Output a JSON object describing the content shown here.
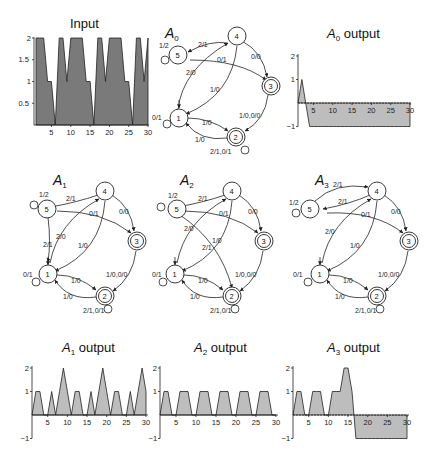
{
  "figure": {
    "panels": {
      "input": {
        "title": "Input"
      },
      "A0": {
        "title_main": "A",
        "title_sub": "0"
      },
      "A0_output": {
        "title_main": "A",
        "title_sub": "0",
        "title_rest": " output"
      },
      "A1": {
        "title_main": "A",
        "title_sub": "1"
      },
      "A2": {
        "title_main": "A",
        "title_sub": "2"
      },
      "A3": {
        "title_main": "A",
        "title_sub": "3"
      },
      "A1_output": {
        "title_main": "A",
        "title_sub": "1",
        "title_rest": " output"
      },
      "A2_output": {
        "title_main": "A",
        "title_sub": "2",
        "title_rest": " output"
      },
      "A3_output": {
        "title_main": "A",
        "title_sub": "3",
        "title_rest": " output"
      }
    },
    "colors": {
      "input_fill": "#7a7a7a",
      "output_fill": "#bdbdbd",
      "line": "#222222"
    }
  },
  "automata": {
    "nodes": {
      "n1": "1",
      "n2": "2",
      "n3": "3",
      "n4": "4",
      "n5": "5"
    },
    "A0": {
      "e_5_self": "1/2",
      "e_4_5": "2/1",
      "e_5_3": "0/1",
      "e_4_3": "0/0",
      "e_1_4": "2/0",
      "e_4_1": "1/0",
      "e_1_self": "0/1",
      "e_1_2": "1/0",
      "e_2_1": "1/0",
      "e_3_2": "1/0,0/0",
      "e_2_self": "2/1,0/1"
    },
    "A1": {
      "e_5_self": "1/2",
      "e_4_5": "2/1",
      "e_5_3": "0/1",
      "e_4_3": "0/0",
      "e_1_4": "2/0",
      "e_5_1": "2/1",
      "e_4_1": "1/0",
      "e_1_self": "0/1",
      "e_1_2": "1/0",
      "e_2_1": "1/0",
      "e_3_2": "1/0,0/0",
      "e_2_self": "2/1,0/1"
    },
    "A2": {
      "e_5_self": "1/2",
      "e_4_5": "2/1",
      "e_5_3": "0/1",
      "e_4_3": "0/0",
      "e_1_4": "2/0",
      "e_5_2": "2/1",
      "e_4_1": "1/0",
      "e_1_self": "0/1",
      "e_1_2": "1/0",
      "e_2_1": "1/0",
      "e_3_2": "1/0,0/0",
      "e_2_self": "2/1,0/1"
    },
    "A3": {
      "e_5_self": "1/2",
      "e_5_4": "2/1",
      "e_4_5": "2/1",
      "e_5_3": "0/1",
      "e_4_3": "0/0",
      "e_1_4": "2/0",
      "e_4_1": "1/0",
      "e_1_self": "0/1",
      "e_1_2": "1/0",
      "e_2_1": "1/0",
      "e_3_2": "1/0,0/0",
      "e_2_self": "2/1,0/1"
    }
  },
  "chart_data": [
    {
      "id": "input",
      "type": "area",
      "title": "Input",
      "xlabel": "",
      "ylabel": "",
      "xlim": [
        1,
        30
      ],
      "ylim": [
        0,
        2
      ],
      "xticks": [
        "5",
        "10",
        "15",
        "20",
        "25",
        "30"
      ],
      "yticks": [
        "0.5",
        "1",
        "1.5",
        "2"
      ],
      "x": [
        1,
        2,
        3,
        4,
        5,
        6,
        7,
        8,
        9,
        10,
        11,
        12,
        13,
        14,
        15,
        16,
        17,
        18,
        19,
        20,
        21,
        22,
        23,
        24,
        25,
        26,
        27,
        28,
        29,
        30
      ],
      "values": [
        2,
        2,
        2,
        1,
        1,
        0,
        2,
        2,
        1,
        2,
        2,
        2,
        2,
        1,
        1,
        0,
        2,
        2,
        1,
        2,
        2,
        2,
        2,
        1,
        1,
        0,
        2,
        2,
        1,
        2
      ]
    },
    {
      "id": "A0_output",
      "type": "area",
      "title": "A0 output",
      "xlim": [
        1,
        30
      ],
      "ylim": [
        -1,
        2
      ],
      "xticks": [
        "5",
        "10",
        "15",
        "20",
        "25",
        "30"
      ],
      "yticks": [
        "-1",
        "1",
        "2"
      ],
      "x": [
        1,
        2,
        3,
        4,
        5,
        6,
        7,
        8,
        9,
        10,
        11,
        12,
        13,
        14,
        15,
        16,
        17,
        18,
        19,
        20,
        21,
        22,
        23,
        24,
        25,
        26,
        27,
        28,
        29,
        30
      ],
      "values": [
        0,
        1,
        0,
        -1,
        -1,
        -1,
        -1,
        -1,
        -1,
        -1,
        -1,
        -1,
        -1,
        -1,
        -1,
        -1,
        -1,
        -1,
        -1,
        -1,
        -1,
        -1,
        -1,
        -1,
        -1,
        -1,
        -1,
        -1,
        -1,
        -1
      ]
    },
    {
      "id": "A1_output",
      "type": "area",
      "title": "A1 output",
      "xlim": [
        1,
        30
      ],
      "ylim": [
        -1,
        2
      ],
      "xticks": [
        "5",
        "10",
        "15",
        "20",
        "25",
        "30"
      ],
      "yticks": [
        "-1",
        "1",
        "2"
      ],
      "x": [
        1,
        2,
        3,
        4,
        5,
        6,
        7,
        8,
        9,
        10,
        11,
        12,
        13,
        14,
        15,
        16,
        17,
        18,
        19,
        20,
        21,
        22,
        23,
        24,
        25,
        26,
        27,
        28,
        29,
        30
      ],
      "values": [
        0,
        1,
        1,
        0,
        0,
        1,
        0,
        1,
        2,
        1,
        0,
        1,
        1,
        0,
        0,
        1,
        0,
        1,
        2,
        1,
        0,
        1,
        1,
        0,
        0,
        1,
        0,
        1,
        2,
        1
      ]
    },
    {
      "id": "A2_output",
      "type": "area",
      "title": "A2 output",
      "xlim": [
        1,
        30
      ],
      "ylim": [
        -1,
        2
      ],
      "xticks": [
        "5",
        "10",
        "15",
        "20",
        "25",
        "30"
      ],
      "yticks": [
        "-1",
        "1",
        "2"
      ],
      "x": [
        1,
        2,
        3,
        4,
        5,
        6,
        7,
        8,
        9,
        10,
        11,
        12,
        13,
        14,
        15,
        16,
        17,
        18,
        19,
        20,
        21,
        22,
        23,
        24,
        25,
        26,
        27,
        28,
        29,
        30
      ],
      "values": [
        0,
        1,
        1,
        0,
        0,
        1,
        1,
        1,
        0,
        0,
        1,
        1,
        1,
        0,
        0,
        1,
        1,
        1,
        0,
        0,
        1,
        1,
        1,
        0,
        0,
        1,
        1,
        1,
        0,
        0
      ]
    },
    {
      "id": "A3_output",
      "type": "area",
      "title": "A3 output",
      "xlim": [
        1,
        30
      ],
      "ylim": [
        -1,
        2
      ],
      "xticks": [
        "5",
        "10",
        "15",
        "20",
        "25",
        "30"
      ],
      "yticks": [
        "-1",
        "1",
        "2"
      ],
      "x": [
        1,
        2,
        3,
        4,
        5,
        6,
        7,
        8,
        9,
        10,
        11,
        12,
        13,
        14,
        15,
        16,
        17,
        18,
        19,
        20,
        21,
        22,
        23,
        24,
        25,
        26,
        27,
        28,
        29,
        30
      ],
      "values": [
        0,
        1,
        1,
        0,
        0,
        1,
        1,
        1,
        0,
        0,
        1,
        1,
        1,
        2,
        2,
        1,
        -1,
        -1,
        -1,
        -1,
        -1,
        -1,
        -1,
        -1,
        -1,
        -1,
        -1,
        -1,
        -1,
        -1
      ]
    }
  ]
}
